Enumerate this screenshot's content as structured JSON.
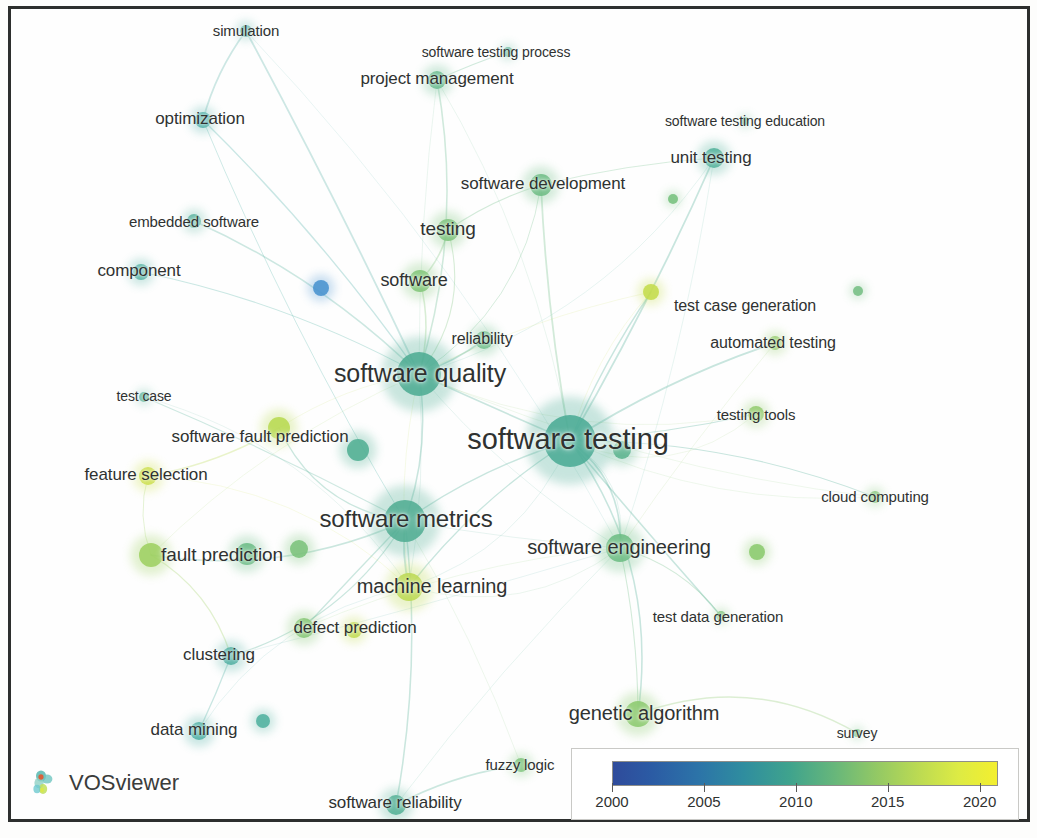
{
  "app": {
    "name": "VOSviewer",
    "logo_icon": "vosviewer-logo-icon"
  },
  "legend": {
    "title": "",
    "ticks": [
      "2000",
      "2005",
      "2010",
      "2015",
      "2020"
    ],
    "min_year": 2000,
    "max_year": 2021,
    "gradient_stops": [
      "#2f4b9b",
      "#2c73a8",
      "#3fa38d",
      "#94c964",
      "#f3ef2f"
    ]
  },
  "chart_data": {
    "type": "scatter",
    "title": "",
    "subtitle": "",
    "xlabel": "",
    "ylabel": "",
    "colormap": "viridis-overlay",
    "color_scale_label": "Average publication year",
    "color_scale_min": 2000,
    "color_scale_max": 2021,
    "legend_position": "bottom-right",
    "grid": false,
    "nodes": [
      {
        "label": "simulation",
        "x": 246,
        "y": 31,
        "r": 6,
        "color": "#5cb3a9",
        "font": 15,
        "lx": 246,
        "ly": 31,
        "label_dx": 0,
        "label_dy": -1
      },
      {
        "label": "software testing process",
        "x": 508,
        "y": 52,
        "r": 5,
        "color": "#63b79c",
        "font": 14,
        "lx": 496,
        "ly": 52,
        "label_dx": 0,
        "label_dy": 0
      },
      {
        "label": "project management",
        "x": 437,
        "y": 80,
        "r": 9,
        "color": "#67bb8e",
        "font": 17,
        "lx": 437,
        "ly": 79,
        "label_dx": 0,
        "label_dy": 0
      },
      {
        "label": "software testing education",
        "x": 745,
        "y": 121,
        "r": 4,
        "color": "#6fba94",
        "font": 14,
        "lx": 745,
        "ly": 121,
        "label_dx": 0,
        "label_dy": 0
      },
      {
        "label": "optimization",
        "x": 203,
        "y": 120,
        "r": 8,
        "color": "#4eb0a8",
        "font": 17,
        "lx": 200,
        "ly": 119,
        "label_dx": 0,
        "label_dy": 0
      },
      {
        "label": "unit testing",
        "x": 714,
        "y": 158,
        "r": 10,
        "color": "#52b29b",
        "font": 17,
        "lx": 711,
        "ly": 158,
        "label_dx": 0,
        "label_dy": 0
      },
      {
        "label": "software development",
        "x": 541,
        "y": 185,
        "r": 11,
        "color": "#6dbd84",
        "font": 17,
        "lx": 543,
        "ly": 184,
        "label_dx": 0,
        "label_dy": 0
      },
      {
        "label": "embedded software",
        "x": 194,
        "y": 221,
        "r": 7,
        "color": "#5bb49f",
        "font": 15,
        "lx": 194,
        "ly": 221,
        "label_dx": 0,
        "label_dy": 0
      },
      {
        "label": "testing",
        "x": 448,
        "y": 230,
        "r": 11,
        "color": "#7ec57d",
        "font": 19,
        "lx": 448,
        "ly": 229,
        "label_dx": 0,
        "label_dy": 0
      },
      {
        "label": "component",
        "x": 141,
        "y": 272,
        "r": 8,
        "color": "#54b2a4",
        "font": 17,
        "lx": 139,
        "ly": 271,
        "label_dx": 0,
        "label_dy": 0
      },
      {
        "label": "software",
        "x": 420,
        "y": 281,
        "r": 11,
        "color": "#81c678",
        "font": 18,
        "lx": 414,
        "ly": 280,
        "label_dx": 0,
        "label_dy": 0
      },
      {
        "label": "",
        "x": 321,
        "y": 288,
        "r": 8,
        "color": "#4a93d0",
        "font": 0,
        "lx": 321,
        "ly": 288,
        "label_dx": 0,
        "label_dy": 0
      },
      {
        "label": "",
        "x": 673,
        "y": 199,
        "r": 5,
        "color": "#78c27f",
        "font": 0,
        "lx": 673,
        "ly": 199,
        "label_dx": 0,
        "label_dy": 0
      },
      {
        "label": "test case generation",
        "x": 651,
        "y": 292,
        "r": 8,
        "color": "#c5dd4d",
        "font": 16,
        "lx": 745,
        "ly": 306,
        "label_dx": 0,
        "label_dy": 0
      },
      {
        "label": "",
        "x": 858,
        "y": 291,
        "r": 5,
        "color": "#77c085",
        "font": 0,
        "lx": 858,
        "ly": 291,
        "label_dx": 0,
        "label_dy": 0
      },
      {
        "label": "automated testing",
        "x": 775,
        "y": 343,
        "r": 7,
        "color": "#95cd6b",
        "font": 16,
        "lx": 773,
        "ly": 343,
        "label_dx": 0,
        "label_dy": 0
      },
      {
        "label": "reliability",
        "x": 484,
        "y": 340,
        "r": 9,
        "color": "#6fbf8b",
        "font": 16,
        "lx": 482,
        "ly": 339,
        "label_dx": 0,
        "label_dy": 0
      },
      {
        "label": "software quality",
        "x": 419,
        "y": 374,
        "r": 22,
        "color": "#4fad94",
        "font": 25,
        "lx": 420,
        "ly": 373,
        "label_dx": 0,
        "label_dy": 0
      },
      {
        "label": "test case",
        "x": 144,
        "y": 397,
        "r": 5,
        "color": "#60b79f",
        "font": 14,
        "lx": 144,
        "ly": 396,
        "label_dx": 0,
        "label_dy": 0
      },
      {
        "label": "testing tools",
        "x": 756,
        "y": 414,
        "r": 8,
        "color": "#93cc6e",
        "font": 15,
        "lx": 756,
        "ly": 414,
        "label_dx": 0,
        "label_dy": 0
      },
      {
        "label": "software fault prediction",
        "x": 279,
        "y": 428,
        "r": 11,
        "color": "#b9da52",
        "font": 17,
        "lx": 260,
        "ly": 437,
        "label_dx": 0,
        "label_dy": 0
      },
      {
        "label": "software testing",
        "x": 570,
        "y": 441,
        "r": 26,
        "color": "#4cac96",
        "font": 29,
        "lx": 568,
        "ly": 439,
        "label_dx": 0,
        "label_dy": 0
      },
      {
        "label": "",
        "x": 358,
        "y": 450,
        "r": 11,
        "color": "#52b094",
        "font": 0,
        "lx": 358,
        "ly": 450,
        "label_dx": 0,
        "label_dy": 0
      },
      {
        "label": "",
        "x": 622,
        "y": 450,
        "r": 9,
        "color": "#5db48f",
        "font": 0,
        "lx": 622,
        "ly": 450,
        "label_dx": 0,
        "label_dy": 0
      },
      {
        "label": "feature selection",
        "x": 148,
        "y": 476,
        "r": 9,
        "color": "#cde04c",
        "font": 17,
        "lx": 146,
        "ly": 475,
        "label_dx": 0,
        "label_dy": 0
      },
      {
        "label": "cloud computing",
        "x": 875,
        "y": 497,
        "r": 6,
        "color": "#84c77a",
        "font": 15,
        "lx": 875,
        "ly": 496,
        "label_dx": 0,
        "label_dy": 0
      },
      {
        "label": "software metrics",
        "x": 405,
        "y": 521,
        "r": 21,
        "color": "#52ae94",
        "font": 24,
        "lx": 406,
        "ly": 519,
        "label_dx": 0,
        "label_dy": 0
      },
      {
        "label": "software engineering",
        "x": 620,
        "y": 548,
        "r": 14,
        "color": "#6dbe84",
        "font": 20,
        "lx": 619,
        "ly": 547,
        "label_dx": 0,
        "label_dy": 0
      },
      {
        "label": "",
        "x": 757,
        "y": 552,
        "r": 8,
        "color": "#8ccb6f",
        "font": 0,
        "lx": 757,
        "ly": 552,
        "label_dx": 0,
        "label_dy": 0
      },
      {
        "label": "fault prediction",
        "x": 151,
        "y": 555,
        "r": 12,
        "color": "#9fd162",
        "font": 19,
        "lx": 222,
        "ly": 555,
        "label_dx": 0,
        "label_dy": 0
      },
      {
        "label": "",
        "x": 247,
        "y": 554,
        "r": 11,
        "color": "#6cbd86",
        "font": 0,
        "lx": 247,
        "ly": 554,
        "label_dx": 0,
        "label_dy": 0
      },
      {
        "label": "",
        "x": 299,
        "y": 549,
        "r": 9,
        "color": "#7cc37c",
        "font": 0,
        "lx": 299,
        "ly": 549,
        "label_dx": 0,
        "label_dy": 0
      },
      {
        "label": "machine learning",
        "x": 409,
        "y": 587,
        "r": 14,
        "color": "#bdda53",
        "font": 20,
        "lx": 432,
        "ly": 586,
        "label_dx": 0,
        "label_dy": 0
      },
      {
        "label": "test data generation",
        "x": 721,
        "y": 616,
        "r": 5,
        "color": "#7fc47b",
        "font": 15,
        "lx": 718,
        "ly": 616,
        "label_dx": 0,
        "label_dy": 0
      },
      {
        "label": "defect prediction",
        "x": 304,
        "y": 628,
        "r": 10,
        "color": "#85c774",
        "font": 17,
        "lx": 355,
        "ly": 628,
        "label_dx": 0,
        "label_dy": 0
      },
      {
        "label": "",
        "x": 354,
        "y": 630,
        "r": 8,
        "color": "#c1dc4f",
        "font": 0,
        "lx": 354,
        "ly": 630,
        "label_dx": 0,
        "label_dy": 0
      },
      {
        "label": "clustering",
        "x": 231,
        "y": 656,
        "r": 9,
        "color": "#4fb0a3",
        "font": 17,
        "lx": 219,
        "ly": 655,
        "label_dx": 0,
        "label_dy": 0
      },
      {
        "label": "genetic algorithm",
        "x": 638,
        "y": 714,
        "r": 13,
        "color": "#8dcb70",
        "font": 20,
        "lx": 644,
        "ly": 713,
        "label_dx": 0,
        "label_dy": 0
      },
      {
        "label": "data mining",
        "x": 199,
        "y": 731,
        "r": 9,
        "color": "#4db0a5",
        "font": 17,
        "lx": 194,
        "ly": 730,
        "label_dx": 0,
        "label_dy": 0
      },
      {
        "label": "",
        "x": 263,
        "y": 721,
        "r": 7,
        "color": "#51b2a0",
        "font": 0,
        "lx": 263,
        "ly": 721,
        "label_dx": 0,
        "label_dy": 0
      },
      {
        "label": "survey",
        "x": 857,
        "y": 733,
        "r": 4,
        "color": "#74c185",
        "font": 14,
        "lx": 857,
        "ly": 733,
        "label_dx": 0,
        "label_dy": 0
      },
      {
        "label": "fuzzy logic",
        "x": 521,
        "y": 765,
        "r": 7,
        "color": "#7dc57b",
        "font": 15,
        "lx": 520,
        "ly": 764,
        "label_dx": 0,
        "label_dy": 0
      },
      {
        "label": "software reliability",
        "x": 396,
        "y": 805,
        "r": 10,
        "color": "#55b297",
        "font": 17,
        "lx": 395,
        "ly": 803,
        "label_dx": 0,
        "label_dy": 0
      }
    ],
    "edges": [
      [
        "simulation",
        "optimization"
      ],
      [
        "simulation",
        "software quality"
      ],
      [
        "optimization",
        "software metrics"
      ],
      [
        "optimization",
        "software quality"
      ],
      [
        "project management",
        "software testing process"
      ],
      [
        "project management",
        "software quality"
      ],
      [
        "software development",
        "software testing"
      ],
      [
        "software development",
        "software quality"
      ],
      [
        "software development",
        "unit testing"
      ],
      [
        "software development",
        "testing"
      ],
      [
        "testing",
        "software"
      ],
      [
        "testing",
        "software quality"
      ],
      [
        "software",
        "software quality"
      ],
      [
        "software quality",
        "software testing"
      ],
      [
        "software quality",
        "software metrics"
      ],
      [
        "software quality",
        "reliability"
      ],
      [
        "software testing",
        "software metrics"
      ],
      [
        "software testing",
        "software engineering"
      ],
      [
        "software testing",
        "test case generation"
      ],
      [
        "software testing",
        "automated testing"
      ],
      [
        "software testing",
        "testing tools"
      ],
      [
        "software testing",
        "unit testing"
      ],
      [
        "software testing",
        "cloud computing"
      ],
      [
        "software testing",
        "genetic algorithm"
      ],
      [
        "software testing",
        "machine learning"
      ],
      [
        "software testing",
        "test data generation"
      ],
      [
        "software metrics",
        "fault prediction"
      ],
      [
        "software metrics",
        "software fault prediction"
      ],
      [
        "software metrics",
        "defect prediction"
      ],
      [
        "software metrics",
        "machine learning"
      ],
      [
        "software metrics",
        "clustering"
      ],
      [
        "software metrics",
        "software reliability"
      ],
      [
        "software fault prediction",
        "feature selection"
      ],
      [
        "fault prediction",
        "feature selection"
      ],
      [
        "fault prediction",
        "clustering"
      ],
      [
        "clustering",
        "data mining"
      ],
      [
        "software engineering",
        "test data generation"
      ],
      [
        "software engineering",
        "genetic algorithm"
      ],
      [
        "genetic algorithm",
        "survey"
      ],
      [
        "software reliability",
        "fuzzy logic"
      ],
      [
        "embedded software",
        "software quality"
      ],
      [
        "component",
        "software quality"
      ],
      [
        "test case",
        "software metrics"
      ]
    ]
  }
}
